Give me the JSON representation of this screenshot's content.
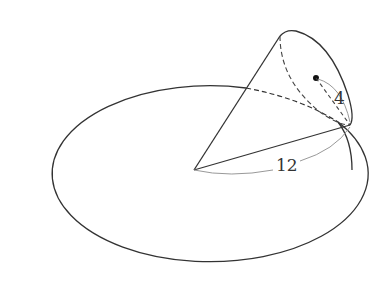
{
  "diagram": {
    "labels": {
      "slant_height": "12",
      "base_radius": "4"
    },
    "colors": {
      "stroke": "#333333",
      "dim_line": "#999999",
      "background": "#ffffff"
    }
  }
}
